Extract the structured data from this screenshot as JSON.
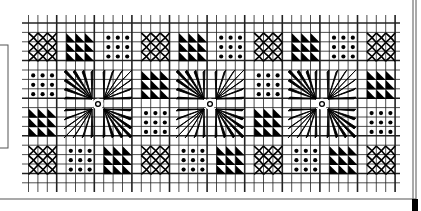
{
  "colors": {
    "ink": "#000000",
    "grid": "#222222",
    "paper": "#ffffff",
    "frame": "#555555"
  },
  "grid": {
    "x0": 22,
    "x1": 400,
    "y0": 23,
    "y1": 184,
    "cell": 9.4,
    "origin_x": 28.5,
    "origin_y": 33,
    "block_pitch_x": 37.6,
    "block_pitch_y": 37.7,
    "block_cells": 3,
    "tick_bottom": 192
  },
  "motif_legend": {
    "X": "cross-lattice-motif",
    "T": "triangle-motif",
    "D": "dot-motif",
    "S": "star-motif"
  },
  "rows": [
    [
      "X",
      "T",
      "D",
      "X",
      "T",
      "D",
      "X",
      "T",
      "D",
      "X"
    ],
    [
      "D",
      "S",
      "S",
      "T",
      "S",
      "S",
      "D",
      "S",
      "S",
      "T"
    ],
    [
      "T",
      "S",
      "S",
      "D",
      "S",
      "S",
      "T",
      "S",
      "S",
      "D"
    ],
    [
      "X",
      "D",
      "T",
      "X",
      "D",
      "T",
      "X",
      "D",
      "T",
      "X"
    ]
  ],
  "stars": [
    {
      "cx": 98,
      "cy": 104
    },
    {
      "cx": 210,
      "cy": 104
    },
    {
      "cx": 322,
      "cy": 104
    }
  ],
  "frame": {
    "left_box": {
      "x": 0,
      "y": 45,
      "w": 8,
      "h": 103
    },
    "right_lines": [
      413,
      416
    ],
    "bottom_line_y": 199,
    "corner_square": {
      "x": 412,
      "y": 199,
      "w": 6,
      "h": 12
    }
  }
}
